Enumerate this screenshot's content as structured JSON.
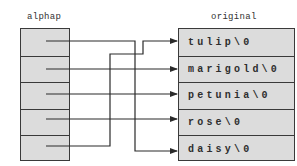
{
  "diagram": {
    "left_array": {
      "label": "alphap",
      "cells": [
        {
          "index": 0,
          "points_to": "daisy\\0"
        },
        {
          "index": 1,
          "points_to": "marigold\\0"
        },
        {
          "index": 2,
          "points_to": "petunia\\0"
        },
        {
          "index": 3,
          "points_to": "rose\\0"
        },
        {
          "index": 4,
          "points_to": "tulip\\0"
        }
      ]
    },
    "right_array": {
      "label": "original",
      "cells": [
        {
          "index": 0,
          "text": "tulip\\0"
        },
        {
          "index": 1,
          "text": "marigold\\0"
        },
        {
          "index": 2,
          "text": "petunia\\0"
        },
        {
          "index": 3,
          "text": "rose\\0"
        },
        {
          "index": 4,
          "text": "daisy\\0"
        }
      ]
    },
    "colors": {
      "cell_fill": "#dcdcdc",
      "border": "#3a3a3a",
      "wire": "#2a2a2a",
      "text": "#2e2e2e"
    }
  }
}
